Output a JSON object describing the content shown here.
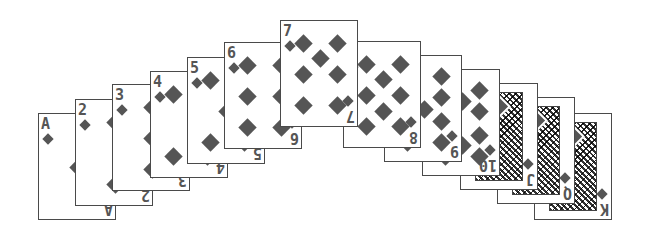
{
  "game": {
    "title": "Card fan - Diamonds",
    "suit": "diamonds",
    "suit_icon": "diamond-icon",
    "colors": {
      "ink": "#555555",
      "border": "#4a4a4a",
      "background": "#ffffff"
    }
  },
  "cards": [
    {
      "rank": "A",
      "x": 38,
      "y": 113,
      "z": 1
    },
    {
      "rank": "2",
      "x": 75,
      "y": 99,
      "z": 2
    },
    {
      "rank": "3",
      "x": 112,
      "y": 84,
      "z": 3
    },
    {
      "rank": "4",
      "x": 150,
      "y": 71,
      "z": 4
    },
    {
      "rank": "5",
      "x": 187,
      "y": 57,
      "z": 5
    },
    {
      "rank": "6",
      "x": 224,
      "y": 42,
      "z": 6
    },
    {
      "rank": "7",
      "x": 280,
      "y": 20,
      "z": 13
    },
    {
      "rank": "8",
      "x": 343,
      "y": 41,
      "z": 12
    },
    {
      "rank": "9",
      "x": 384,
      "y": 55,
      "z": 11
    },
    {
      "rank": "10",
      "x": 422,
      "y": 69,
      "z": 10
    },
    {
      "rank": "J",
      "x": 460,
      "y": 83,
      "z": 9
    },
    {
      "rank": "Q",
      "x": 497,
      "y": 97,
      "z": 8
    },
    {
      "rank": "K",
      "x": 534,
      "y": 113,
      "z": 7
    }
  ]
}
